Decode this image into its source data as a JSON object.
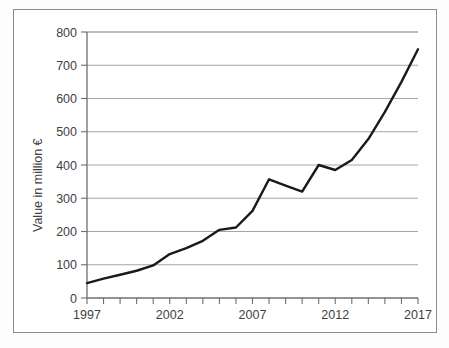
{
  "chart_data": {
    "type": "line",
    "title": "",
    "subtitle": "",
    "xlabel": "",
    "ylabel": "Value in million €",
    "xlim": [
      1997,
      2017
    ],
    "ylim": [
      0,
      800
    ],
    "grid": "horizontal",
    "legend": "none",
    "y_ticks": [
      0,
      100,
      200,
      300,
      400,
      500,
      600,
      700,
      800
    ],
    "y_tick_labels": [
      "0",
      "100",
      "200",
      "300",
      "400",
      "500",
      "600",
      "700",
      "800"
    ],
    "x_ticks": [
      1997,
      1998,
      1999,
      2000,
      2001,
      2002,
      2003,
      2004,
      2005,
      2006,
      2007,
      2008,
      2009,
      2010,
      2011,
      2012,
      2013,
      2014,
      2015,
      2016,
      2017
    ],
    "x_tick_labels_shown": [
      "1997",
      "2002",
      "2007",
      "2012",
      "2017"
    ],
    "x": [
      1997,
      1998,
      1999,
      2000,
      2001,
      2002,
      2003,
      2004,
      2005,
      2006,
      2007,
      2008,
      2009,
      2010,
      2011,
      2012,
      2013,
      2014,
      2015,
      2016,
      2017
    ],
    "values": [
      45,
      58,
      70,
      82,
      98,
      132,
      150,
      172,
      205,
      212,
      262,
      357,
      338,
      320,
      400,
      385,
      415,
      478,
      560,
      650,
      748
    ],
    "series": [
      {
        "name": "Value in million €",
        "color": "#1a1a1a",
        "values": [
          45,
          58,
          70,
          82,
          98,
          132,
          150,
          172,
          205,
          212,
          262,
          357,
          338,
          320,
          400,
          385,
          415,
          478,
          560,
          650,
          748
        ]
      }
    ]
  },
  "style": {
    "line_color": "#1a1a1a",
    "grid_color": "#a6a6a6",
    "axis_color": "#6f6f6f",
    "frame_color": "#8d8d8d",
    "text_color": "#3f3f3f",
    "background": "#ffffff"
  }
}
